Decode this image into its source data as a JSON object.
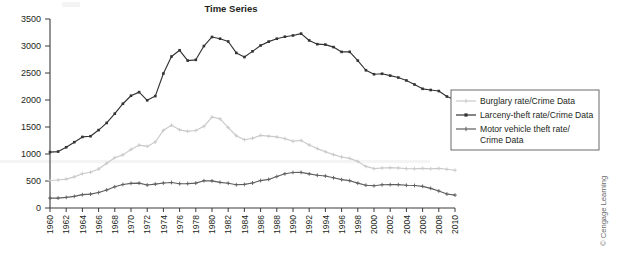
{
  "chart_data": {
    "type": "line",
    "title": "Time Series",
    "xlabel": "",
    "ylabel": "",
    "xlim": [
      1960,
      2010
    ],
    "ylim": [
      0,
      3500
    ],
    "yticks": [
      0,
      500,
      1000,
      1500,
      2000,
      2500,
      3000,
      3500
    ],
    "xticks": [
      1960,
      1962,
      1964,
      1966,
      1968,
      1970,
      1972,
      1974,
      1976,
      1978,
      1980,
      1982,
      1984,
      1986,
      1988,
      1990,
      1992,
      1994,
      1996,
      1998,
      2000,
      2002,
      2004,
      2006,
      2008,
      2010
    ],
    "grid": false,
    "legend_position": "right",
    "x": [
      1960,
      1961,
      1962,
      1963,
      1964,
      1965,
      1966,
      1967,
      1968,
      1969,
      1970,
      1971,
      1972,
      1973,
      1974,
      1975,
      1976,
      1977,
      1978,
      1979,
      1980,
      1981,
      1982,
      1983,
      1984,
      1985,
      1986,
      1987,
      1988,
      1989,
      1990,
      1991,
      1992,
      1993,
      1994,
      1995,
      1996,
      1997,
      1998,
      1999,
      2000,
      2001,
      2002,
      2003,
      2004,
      2005,
      2006,
      2007,
      2008,
      2009,
      2010
    ],
    "series": [
      {
        "name": "Burglary rate/Crime Data",
        "color": "#c9c9c9",
        "marker": "+",
        "values": [
          509,
          519,
          535,
          576,
          635,
          663,
          721,
          827,
          932,
          984,
          1085,
          1164,
          1141,
          1223,
          1438,
          1532,
          1448,
          1420,
          1435,
          1512,
          1684,
          1650,
          1489,
          1338,
          1264,
          1292,
          1345,
          1330,
          1316,
          1284,
          1236,
          1252,
          1168,
          1100,
          1042,
          988,
          945,
          919,
          863,
          770,
          729,
          741,
          747,
          741,
          730,
          727,
          733,
          726,
          733,
          717,
          700
        ]
      },
      {
        "name": "Larceny-theft rate/Crime Data",
        "color": "#333333",
        "marker": "diamond",
        "values": [
          1035,
          1045,
          1125,
          1219,
          1316,
          1329,
          1443,
          1576,
          1747,
          1931,
          2079,
          2146,
          1994,
          2072,
          2490,
          2805,
          2921,
          2730,
          2744,
          2999,
          3167,
          3135,
          3084,
          2872,
          2795,
          2901,
          3010,
          3081,
          3135,
          3172,
          3195,
          3229,
          3103,
          3034,
          3026,
          2980,
          2891,
          2892,
          2729,
          2551,
          2477,
          2486,
          2451,
          2416,
          2362,
          2287,
          2207,
          2185,
          2166,
          2064,
          2004
        ]
      },
      {
        "name": "Motor vehicle theft rate/Crime Data",
        "color": "#5e5e5e",
        "marker": "+",
        "values": [
          183,
          184,
          197,
          216,
          247,
          257,
          286,
          334,
          393,
          436,
          457,
          460,
          426,
          443,
          462,
          473,
          450,
          452,
          461,
          505,
          502,
          475,
          459,
          431,
          437,
          463,
          508,
          529,
          583,
          634,
          658,
          659,
          632,
          606,
          592,
          560,
          526,
          506,
          460,
          422,
          412,
          431,
          433,
          433,
          421,
          417,
          401,
          364,
          315,
          259,
          239
        ]
      }
    ]
  },
  "credit": {
    "text": "© Cengage Learning"
  }
}
